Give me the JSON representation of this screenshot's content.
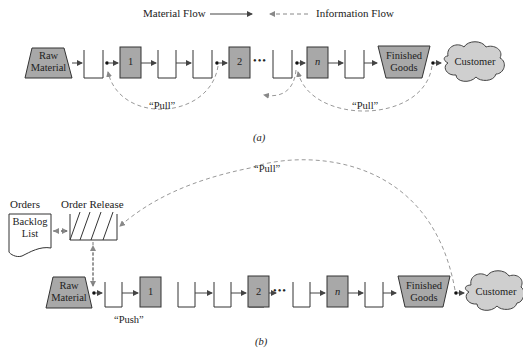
{
  "legend": {
    "material_flow": "Material Flow",
    "information_flow": "Information Flow"
  },
  "colors": {
    "node_fill": "#a8a8a8",
    "cloud_fill": "#cfcfcf",
    "stroke": "#333333",
    "dashed": "#999999"
  },
  "diagram_a": {
    "caption": "(a)",
    "raw_material": [
      "Raw",
      "Material"
    ],
    "stations": [
      "1",
      "2",
      "n"
    ],
    "ellipsis": "•••",
    "finished_goods": [
      "Finished",
      "Goods"
    ],
    "customer": "Customer",
    "pull_labels": [
      "“Pull”",
      "“Pull”"
    ]
  },
  "diagram_b": {
    "caption": "(b)",
    "orders_title": "Orders",
    "backlog": [
      "Backlog",
      "List"
    ],
    "order_release": "Order Release",
    "raw_material": [
      "Raw",
      "Material"
    ],
    "stations": [
      "1",
      "2",
      "n"
    ],
    "ellipsis": "•••",
    "finished_goods": [
      "Finished",
      "Goods"
    ],
    "customer": "Customer",
    "pull_label": "“Pull”",
    "push_label": "“Push”"
  }
}
